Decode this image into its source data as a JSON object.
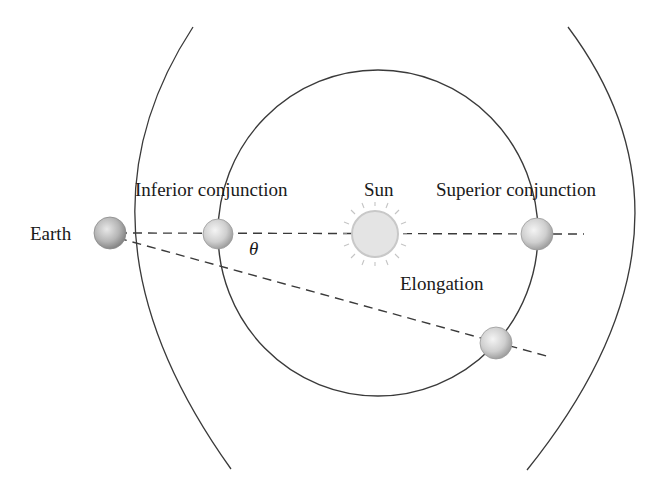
{
  "diagram": {
    "labels": {
      "earth": "Earth",
      "inferior_conjunction": "Inferior conjunction",
      "sun": "Sun",
      "superior_conjunction": "Superior conjunction",
      "elongation": "Elongation",
      "theta": "θ"
    },
    "colors": {
      "line": "#3a3a3a",
      "planet_fill": "#d8d8d8",
      "sun_fill": "#e6e6e6",
      "sun_rays": "#c8c8c8"
    },
    "geometry": {
      "inner_orbit": {
        "cx": 378,
        "cy": 233,
        "r": 162
      },
      "earth": {
        "cx": 110,
        "cy": 233,
        "r": 16
      },
      "sun": {
        "cx": 375,
        "cy": 234,
        "r": 22
      },
      "planets": [
        {
          "name": "inferior",
          "cx": 218,
          "cy": 234
        },
        {
          "name": "superior",
          "cx": 537,
          "cy": 234
        },
        {
          "name": "elongation",
          "cx": 496,
          "cy": 343
        }
      ]
    }
  }
}
